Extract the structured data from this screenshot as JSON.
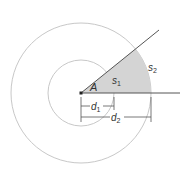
{
  "diagram": {
    "type": "concentric-circles-sector",
    "center": {
      "x": 81,
      "y": 93
    },
    "inner_radius": 33,
    "outer_radius": 70,
    "angle_deg": 39,
    "colors": {
      "circle_stroke": "#c8c8c8",
      "ray_stroke": "#555555",
      "sector_fill": "#d4d4d4",
      "dimension_stroke": "#555555",
      "label": "#333333"
    },
    "labels": {
      "angle": "A",
      "inner_arc": {
        "base": "s",
        "sub": "1"
      },
      "outer_arc": {
        "base": "s",
        "sub": "2"
      },
      "inner_distance": {
        "base": "d",
        "sub": "1"
      },
      "outer_distance": {
        "base": "d",
        "sub": "2"
      }
    }
  }
}
